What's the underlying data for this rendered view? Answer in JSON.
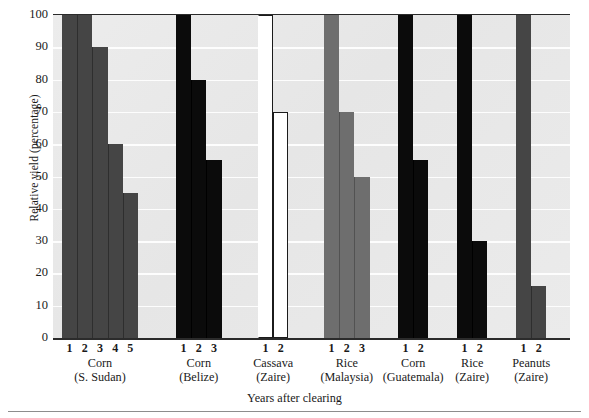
{
  "chart_data": {
    "type": "bar",
    "title": "",
    "xlabel": "Years after clearing",
    "ylabel": "Relative yield (percentage)",
    "ylim": [
      0,
      100
    ],
    "ytick_labels": [
      "100",
      "90",
      "80",
      "70",
      "60",
      "50",
      "40",
      "30",
      "20",
      "10",
      "0"
    ],
    "ytick_values": [
      100,
      90,
      80,
      70,
      60,
      50,
      40,
      30,
      20,
      10,
      0
    ],
    "grid": true,
    "grid_axis": "y",
    "legend": "none",
    "x_category_label": "Years after clearing",
    "groups": [
      {
        "crop": "Corn",
        "place": "(S. Sudan)",
        "fill": "dark-gray",
        "color": "#454545",
        "x": [
          "1",
          "2",
          "3",
          "4",
          "5"
        ],
        "values": [
          100,
          100,
          90,
          60,
          45
        ]
      },
      {
        "crop": "Corn",
        "place": "(Belize)",
        "fill": "black",
        "color": "#0b0b0b",
        "x": [
          "1",
          "2",
          "3"
        ],
        "values": [
          100,
          80,
          55
        ]
      },
      {
        "crop": "Cassava",
        "place": "(Zaire)",
        "fill": "white",
        "color": "#ffffff",
        "x": [
          "1",
          "2"
        ],
        "values": [
          100,
          70
        ]
      },
      {
        "crop": "Rice",
        "place": "(Malaysia)",
        "fill": "medium-gray",
        "color": "#6e6e6e",
        "x": [
          "1",
          "2",
          "3"
        ],
        "values": [
          100,
          70,
          50
        ]
      },
      {
        "crop": "Corn",
        "place": "(Guatemala)",
        "fill": "black",
        "color": "#0b0b0b",
        "x": [
          "1",
          "2"
        ],
        "values": [
          100,
          55
        ]
      },
      {
        "crop": "Rice",
        "place": "(Zaire)",
        "fill": "black",
        "color": "#0b0b0b",
        "x": [
          "1",
          "2"
        ],
        "values": [
          100,
          30
        ]
      },
      {
        "crop": "Peanuts",
        "place": "(Zaire)",
        "fill": "dark-gray",
        "color": "#454545",
        "x": [
          "1",
          "2"
        ],
        "values": [
          100,
          16
        ]
      }
    ]
  },
  "layout": {
    "plot_background": "#e9e9e9",
    "gridline_color": "#fdfdfd",
    "axis_color": "#2b2b2b"
  }
}
